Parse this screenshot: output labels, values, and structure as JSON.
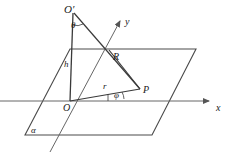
{
  "figure": {
    "type": "geometry-diagram",
    "stroke_color": "#3a3a3a",
    "axis_color": "#555555",
    "background": "#ffffff"
  },
  "labels": {
    "o_prime": "O′",
    "theta": "θ",
    "y_axis": "y",
    "point_r": "R",
    "height": "h",
    "radius": "r",
    "phi": "φ",
    "point_p": "P",
    "origin": "O",
    "x_axis": "x",
    "plane_alpha": "α"
  },
  "geometry": {
    "origin": [
      70,
      101
    ],
    "o_prime": [
      74,
      12
    ],
    "point_r": [
      109,
      50
    ],
    "point_p": [
      140,
      89
    ],
    "plane_corners": [
      [
        70,
        49
      ],
      [
        196,
        49
      ],
      [
        152,
        135
      ],
      [
        25,
        135
      ]
    ],
    "x_axis": {
      "from": [
        0,
        101
      ],
      "to": [
        212,
        101
      ],
      "arrow": true
    },
    "y_axis": {
      "from": [
        50,
        152
      ],
      "to": [
        122,
        18
      ],
      "arrow": true
    },
    "segments": [
      {
        "name": "height-h",
        "from": [
          70,
          101
        ],
        "to": [
          74,
          12
        ]
      },
      {
        "name": "o-prime-to-p",
        "from": [
          74,
          12
        ],
        "to": [
          140,
          89
        ]
      },
      {
        "name": "r-to-p",
        "from": [
          109,
          50
        ],
        "to": [
          140,
          89
        ]
      },
      {
        "name": "o-to-p-radius",
        "from": [
          70,
          101
        ],
        "to": [
          140,
          89
        ]
      },
      {
        "name": "plane-top-edge-left",
        "from": [
          70,
          49
        ],
        "to": [
          196,
          49
        ]
      }
    ]
  }
}
